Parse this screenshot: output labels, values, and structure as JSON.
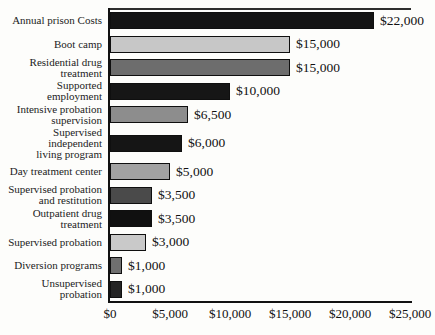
{
  "chart_data": {
    "type": "bar",
    "orientation": "horizontal",
    "title": "",
    "xlabel": "",
    "ylabel": "",
    "xlim": [
      0,
      25000
    ],
    "grid": false,
    "legend": "none",
    "categories": [
      "Annual prison Costs",
      "Boot camp",
      "Residential drug treatment",
      "Supported employment",
      "Intensive probation supervision",
      "Supervised independent living program",
      "Day treatment center",
      "Supervised probation and restitution",
      "Outpatient drug treatment",
      "Supervised probation",
      "Diversion programs",
      "Unsupervised probation"
    ],
    "category_display_lines": [
      [
        "Annual prison Costs"
      ],
      [
        "Boot camp"
      ],
      [
        "Residential drug",
        "treatment"
      ],
      [
        "Supported employment"
      ],
      [
        "Intensive probation",
        "supervision"
      ],
      [
        "Supervised independent",
        "living program"
      ],
      [
        "Day treatment center"
      ],
      [
        "Supervised probation",
        "and restitution"
      ],
      [
        "Outpatient drug",
        "treatment"
      ],
      [
        "Supervised probation"
      ],
      [
        "Diversion programs"
      ],
      [
        "Unsupervised probation"
      ]
    ],
    "values": [
      22000,
      15000,
      15000,
      10000,
      6500,
      6000,
      5000,
      3500,
      3500,
      3000,
      1000,
      1000
    ],
    "value_labels": [
      "$22,000",
      "$15,000",
      "$15,000",
      "$10,000",
      "$6,500",
      "$6,000",
      "$5,000",
      "$3,500",
      "$3,500",
      "$3,000",
      "$1,000",
      "$1,000"
    ],
    "bar_colors": [
      "#141414",
      "#c7c7c7",
      "#6d6d6d",
      "#161616",
      "#8d8d8d",
      "#151515",
      "#a2a2a2",
      "#4a4a4a",
      "#101010",
      "#c9c9c9",
      "#6f6f6f",
      "#242424"
    ],
    "x_tick_values": [
      0,
      5000,
      10000,
      15000,
      20000,
      25000
    ],
    "x_tick_labels": [
      "$0",
      "$5,000",
      "$10,000",
      "$15,000",
      "$20,000",
      "$25,000"
    ]
  },
  "colors": {
    "background": "#fdfdfb",
    "bar_outline": "#0f0f0f",
    "axis_line": "#111111",
    "plot_top_line": "#2e2e2e",
    "text": "#111111"
  }
}
